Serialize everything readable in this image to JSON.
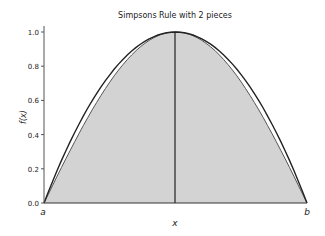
{
  "chart_data": {
    "type": "area",
    "title": "Simpsons Rule with 2 pieces",
    "xlabel": "x",
    "ylabel": "f(x)",
    "x_tick_labels": [
      "a",
      "b"
    ],
    "y_ticks": [
      "0.0",
      "0.2",
      "0.4",
      "0.6",
      "0.8",
      "1.0"
    ],
    "ylim": [
      0,
      1.0
    ],
    "series": [
      {
        "name": "f(x)",
        "x": [
          0,
          0.5,
          1
        ],
        "values": [
          0,
          1.0,
          0
        ]
      },
      {
        "name": "Simpson parabola approximation",
        "x": [
          0,
          0.5,
          1
        ],
        "values": [
          0,
          1.0,
          0
        ]
      }
    ],
    "midpoint_line_x": 0.5,
    "fill_color": "#d3d3d3"
  }
}
